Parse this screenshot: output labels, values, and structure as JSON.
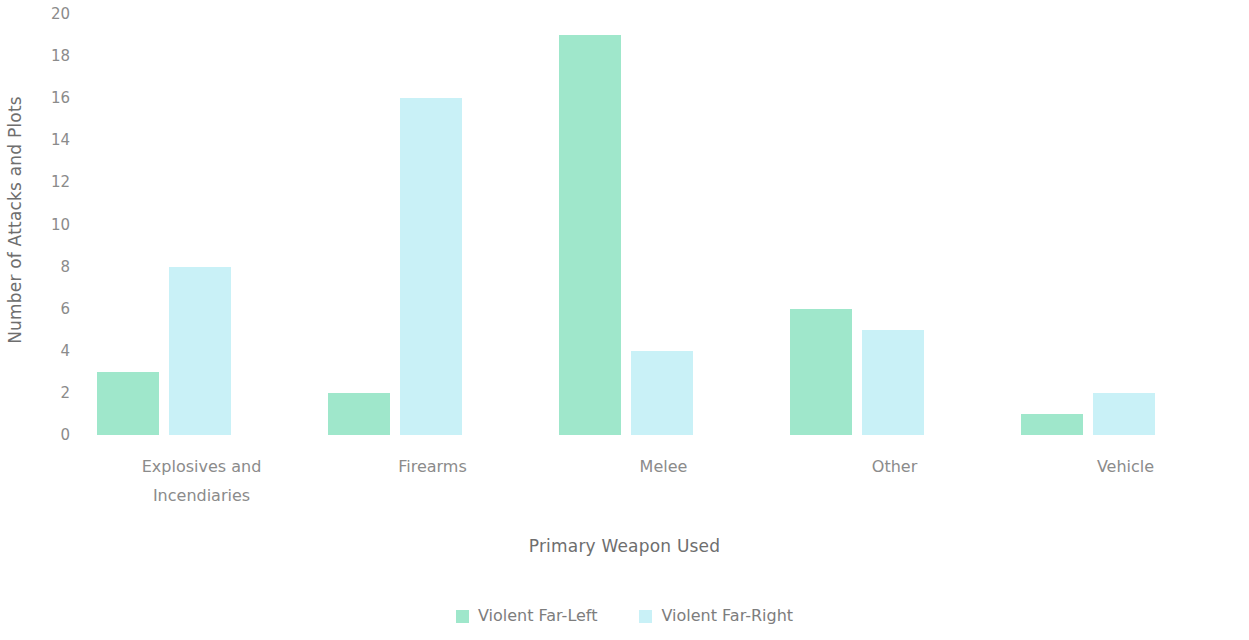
{
  "chart_data": {
    "type": "bar",
    "title": "",
    "subtitle": "",
    "xlabel": "Primary Weapon Used",
    "ylabel": "Number of Attacks and Plots",
    "categories": [
      "Explosives and Incendiaries",
      "Firearms",
      "Melee",
      "Other",
      "Vehicle"
    ],
    "category_lines": [
      [
        "Explosives and",
        "Incendiaries"
      ],
      [
        "Firearms",
        ""
      ],
      [
        "Melee",
        ""
      ],
      [
        "Other",
        ""
      ],
      [
        "Vehicle",
        ""
      ]
    ],
    "series": [
      {
        "name": "Violent Far-Left",
        "color": "#9FE7CB",
        "values": [
          3,
          2,
          19,
          6,
          1
        ]
      },
      {
        "name": "Violent Far-Right",
        "color": "#C9F1F7",
        "values": [
          8,
          16,
          4,
          5,
          2
        ]
      }
    ],
    "ylim": [
      0,
      20
    ],
    "ytick_step": 2,
    "ytick_labels": [
      "20",
      "18",
      "16",
      "14",
      "12",
      "10",
      "8",
      "6",
      "4",
      "2",
      "0"
    ],
    "ytick_values": [
      20,
      18,
      16,
      14,
      12,
      10,
      8,
      6,
      4,
      2,
      0
    ],
    "grid": false,
    "legend_position": "bottom",
    "background_color": "#FFFFFF",
    "text_color": "#808080"
  },
  "legend": {
    "items": [
      {
        "label": "Violent Far-Left",
        "color": "#9FE7CB"
      },
      {
        "label": "Violent Far-Right",
        "color": "#C9F1F7"
      }
    ]
  }
}
